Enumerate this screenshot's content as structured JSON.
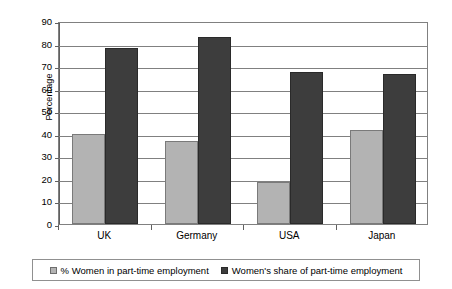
{
  "chart_data": {
    "type": "bar",
    "title": "",
    "subtitle": "",
    "xlabel": "",
    "ylabel": "Percentage",
    "ylim": [
      0,
      90
    ],
    "ytick_step": 10,
    "yticks": [
      "90",
      "80",
      "70",
      "60",
      "50",
      "40",
      "30",
      "20",
      "10",
      "0"
    ],
    "grid": true,
    "legend_position": "bottom",
    "categories": [
      "UK",
      "Germany",
      "USA",
      "Japan"
    ],
    "series": [
      {
        "name": "% Women in part-time employment",
        "color": "#b3b3b3",
        "values": [
          40,
          37,
          18.5,
          41.5
        ]
      },
      {
        "name": "Women's share of part-time employment",
        "color": "#3d3d3d",
        "values": [
          78,
          83,
          67.5,
          66.5
        ]
      }
    ]
  },
  "axis": {
    "y_title": "Percentage"
  },
  "legend": {
    "items": [
      {
        "label": "% Women in part-time employment",
        "swatch": "series-a-swatch"
      },
      {
        "label": "Women's share of part-time employment",
        "swatch": "series-b-swatch"
      }
    ]
  },
  "colors": {
    "series_a": "#b3b3b3",
    "series_b": "#3d3d3d",
    "gridline": "#808080",
    "frame": "#808080",
    "text": "#000000",
    "background": "#ffffff"
  }
}
